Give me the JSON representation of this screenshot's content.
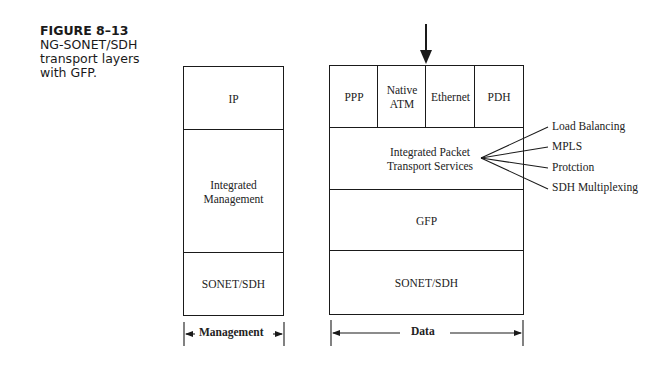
{
  "caption": {
    "figure_number": "FIGURE 8–13",
    "lines": [
      "NG-SONET/SDH",
      "transport layers",
      "with GFP."
    ]
  },
  "management_stack": {
    "layers": [
      "IP",
      "Integrated Management",
      "SONET/SDH"
    ],
    "dimension_label": "Management"
  },
  "data_stack": {
    "top_row": [
      "PPP",
      "Native ATM",
      "Ethernet",
      "PDH"
    ],
    "layers": [
      "Integrated Packet Transport Services",
      "GFP",
      "SONET/SDH"
    ],
    "dimension_label": "Data"
  },
  "services": [
    "Load Balancing",
    "MPLS",
    "Protction",
    "SDH Multiplexing"
  ]
}
